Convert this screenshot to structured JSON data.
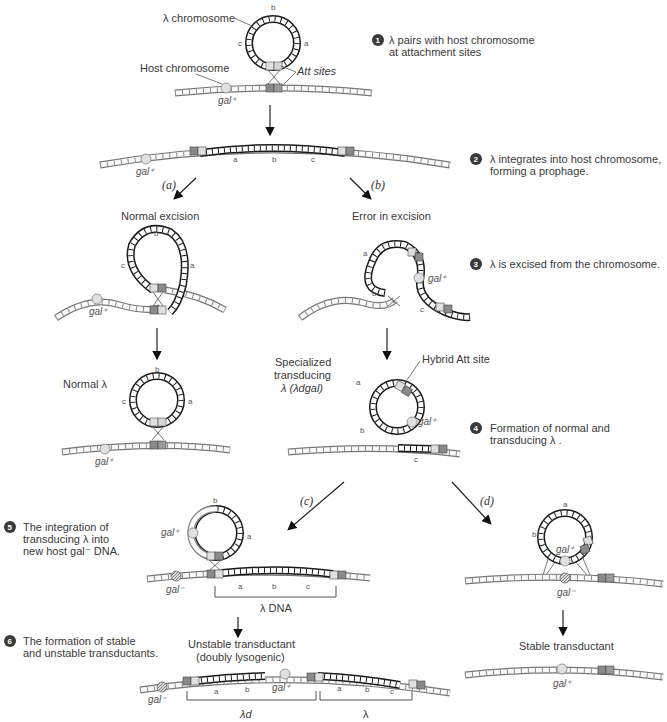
{
  "steps": [
    {
      "num": "1",
      "text_line1": "λ pairs with host chromosome",
      "text_line2": "at attachment sites"
    },
    {
      "num": "2",
      "text_line1": "λ integrates into host chromosome,",
      "text_line2": "forming a prophage."
    },
    {
      "num": "3",
      "text_line1": "λ is excised from the chromosome.",
      "text_line2": ""
    },
    {
      "num": "4",
      "text_line1": "Formation of normal and",
      "text_line2": "transducing λ ."
    },
    {
      "num": "5",
      "text_line1": "The integration of",
      "text_line2": "transducing λ into",
      "text_line3": "new host gal⁻ DNA."
    },
    {
      "num": "6",
      "text_line1": "The formation of stable",
      "text_line2": "and unstable transductants."
    }
  ],
  "labels": {
    "lambda_chromosome": "λ chromosome",
    "host_chromosome": "Host chromosome",
    "att_sites": "Att sites",
    "gal_plus": "gal⁺",
    "gal_minus": "gal⁻",
    "a": "a",
    "b": "b",
    "c": "c",
    "path_a": "(a)",
    "path_b": "(b)",
    "path_c": "(c)",
    "path_d": "(d)",
    "normal_excision": "Normal excision",
    "error_in_excision": "Error in excision",
    "normal_lambda": "Normal λ",
    "specialized_line1": "Specialized",
    "specialized_line2": "transducing",
    "specialized_line3": "λ (λdgal)",
    "hybrid_att": "Hybrid Att site",
    "lambda_dna": "λ DNA",
    "unstable_line1": "Unstable transductant",
    "unstable_line2": "(doubly lysogenic)",
    "stable": "Stable transductant",
    "lambda_d": "λd",
    "lambda": "λ"
  },
  "colors": {
    "host_strand": "#777777",
    "lambda_strand": "#1a1a1a",
    "att_light": "#d8d8d8",
    "att_dark": "#8a8a8a",
    "gal_bead": "#dcdcdc",
    "badge": "#3a3a3a"
  }
}
